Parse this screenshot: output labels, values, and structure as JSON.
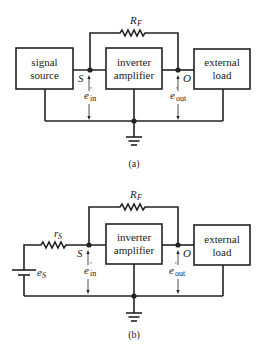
{
  "figure_a": {
    "caption": "(a)",
    "blocks": {
      "signal_source": [
        "signal",
        "source"
      ],
      "inverter": [
        "inverter",
        "amplifier"
      ],
      "load": [
        "external",
        "load"
      ]
    },
    "feedback_resistor": {
      "main": "R",
      "sub": "F"
    },
    "node_s": "S",
    "node_o": "O",
    "e_in": {
      "main": "e",
      "prime": "′",
      "sub": "in"
    },
    "e_out": {
      "main": "e",
      "prime": "′",
      "sub": "out"
    }
  },
  "figure_b": {
    "caption": "(b)",
    "blocks": {
      "inverter": [
        "inverter",
        "amplifier"
      ],
      "load": [
        "external",
        "load"
      ]
    },
    "feedback_resistor": {
      "main": "R",
      "sub": "F"
    },
    "source_resistor": {
      "main": "r",
      "sub": "S"
    },
    "source_voltage": {
      "main": "e",
      "sub": "S"
    },
    "node_s": "S",
    "node_o": "O",
    "e_in": {
      "main": "e",
      "prime": "′",
      "sub": "in"
    },
    "e_out": {
      "main": "e",
      "prime": "′",
      "sub": "out"
    }
  }
}
